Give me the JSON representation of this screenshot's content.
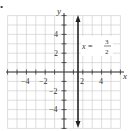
{
  "bullet": "•",
  "chart_data": {
    "type": "line",
    "title": "",
    "xlabel": "x",
    "ylabel": "y",
    "xlim": [
      -6,
      6
    ],
    "ylim": [
      -6,
      6
    ],
    "grid": true,
    "x_ticks": [
      -4,
      -2,
      2,
      4
    ],
    "y_ticks": [
      4,
      2,
      -2,
      -4
    ],
    "x_tick_labels": [
      "−4",
      "−2",
      "2",
      "4"
    ],
    "y_tick_labels": [
      "4",
      "2",
      "−2",
      "−4"
    ],
    "series": [
      {
        "name": "x = 3/2",
        "kind": "vertical-line",
        "x": 1.5,
        "y_range": [
          -6,
          6
        ],
        "arrows": "both"
      }
    ],
    "annotations": [
      {
        "text": "x =",
        "numerator": "3",
        "denominator": "2",
        "at": [
          2.0,
          3.0
        ]
      }
    ]
  },
  "labels": {
    "x_axis": "x",
    "y_axis": "y",
    "eq_lhs": "x =",
    "eq_num": "3",
    "eq_den": "2",
    "xt0": "−4",
    "xt1": "−2",
    "xt2": "2",
    "xt3": "4",
    "yt0": "4",
    "yt1": "2",
    "yt2": "−2",
    "yt3": "−4"
  }
}
